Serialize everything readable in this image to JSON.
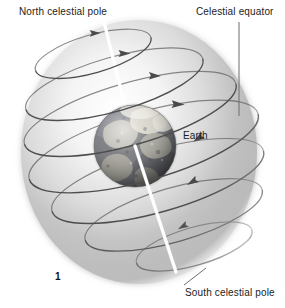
{
  "figure": {
    "number": "1",
    "background_color": "#ffffff",
    "text_color": "#1c1c1c"
  },
  "labels": {
    "north_celestial_pole": "North celestial pole",
    "celestial_equator": "Celestial equator",
    "earth": "Earth",
    "south_celestial_pole": "South celestial pole"
  },
  "colors": {
    "sphere_light": "#fdfdfd",
    "sphere_mid": "#cfcfcf",
    "sphere_dark": "#8e8e8e",
    "sphere_edge": "#ffffff",
    "ring_stroke": "#5a5a5a",
    "axis_line": "#ffffff",
    "leader_line": "#6d6d6d",
    "earth_land": "#b9b7b0",
    "earth_ocean": "#6f6f72",
    "earth_shadow": "#3a3a3c",
    "earth_highlight": "#e6e4dd"
  },
  "geometry": {
    "sphere_center_x": 139,
    "sphere_center_y": 152,
    "sphere_radius_x": 118,
    "sphere_radius_y": 132,
    "earth_center_x": 135,
    "earth_center_y": 146,
    "earth_radius": 41,
    "axis_top_x": 104,
    "axis_top_y": 22,
    "axis_bottom_x": 176,
    "axis_bottom_y": 272,
    "ring_tilt_degrees": -16
  },
  "rings": [
    {
      "name": "ring-near-north-pole",
      "cx": 122,
      "cy": 45,
      "rx": 60,
      "ry": 19,
      "arrow_t": 0.3
    },
    {
      "name": "ring-north-mid",
      "cx": 134,
      "cy": 80,
      "rx": 92,
      "ry": 27,
      "arrow_t": 0.28
    },
    {
      "name": "ring-north-upper-mid",
      "cx": 141,
      "cy": 113,
      "rx": 110,
      "ry": 31,
      "arrow_t": 0.27
    },
    {
      "name": "ring-celestial-equator",
      "cx": 145,
      "cy": 148,
      "rx": 119,
      "ry": 34,
      "arrow_t": 0.26
    },
    {
      "name": "ring-south-lower-mid",
      "cx": 149,
      "cy": 185,
      "rx": 110,
      "ry": 31,
      "arrow_t": 0.26
    },
    {
      "name": "ring-south-mid",
      "cx": 155,
      "cy": 222,
      "rx": 92,
      "ry": 27,
      "arrow_t": 0.25
    },
    {
      "name": "ring-near-south-pole",
      "cx": 166,
      "cy": 258,
      "rx": 60,
      "ry": 19,
      "arrow_t": 0.24
    }
  ],
  "leader_lines": [
    {
      "name": "celestial-equator-leader",
      "x1": 239,
      "y1": 22,
      "x2": 239,
      "y2": 116
    },
    {
      "name": "south-celestial-pole-leader",
      "x1": 184,
      "y1": 285,
      "x2": 205,
      "y2": 268
    }
  ]
}
